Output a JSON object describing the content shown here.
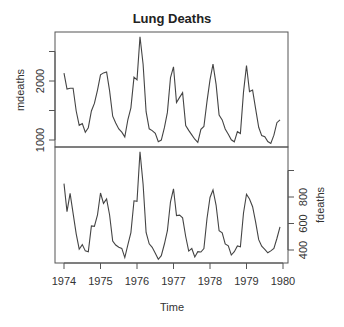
{
  "chart_data": {
    "type": "line",
    "title": "Lung Deaths",
    "xlabel": "Time",
    "x_ticks": [
      "1974",
      "1975",
      "1976",
      "1977",
      "1978",
      "1979",
      "1980"
    ],
    "x_range": [
      1974,
      1980
    ],
    "frequency": 12,
    "start": 1974,
    "grid": false,
    "legend": null,
    "panels": [
      {
        "name": "mdeaths",
        "ylabel": "mdeaths",
        "axis_side": "left",
        "y_ticks": [
          1000,
          1500,
          2000,
          2500
        ],
        "y_tick_labels": [
          "1000",
          "",
          "2000",
          ""
        ],
        "values": [
          2134,
          1863,
          1877,
          1877,
          1492,
          1249,
          1280,
          1131,
          1209,
          1492,
          1621,
          1846,
          2103,
          2137,
          2153,
          1833,
          1403,
          1288,
          1186,
          1133,
          1053,
          1347,
          1545,
          2066,
          2020,
          2750,
          2283,
          1479,
          1189,
          1160,
          1113,
          970,
          999,
          1208,
          1467,
          2059,
          2240,
          1634,
          1722,
          1801,
          1246,
          1162,
          1087,
          1013,
          959,
          1179,
          1229,
          1655,
          2019,
          2284,
          1942,
          1423,
          1340,
          1187,
          1098,
          1004,
          970,
          1140,
          1110,
          1812,
          2263,
          1820,
          1846,
          1531,
          1215,
          1075,
          1056,
          975,
          940,
          1081,
          1294,
          1341
        ]
      },
      {
        "name": "fdeaths",
        "ylabel": "fdeaths",
        "axis_side": "right",
        "y_ticks": [
          400,
          600,
          800,
          1000
        ],
        "y_tick_labels": [
          "400",
          "600",
          "800",
          ""
        ],
        "values": [
          901,
          689,
          827,
          677,
          522,
          406,
          441,
          393,
          387,
          582,
          578,
          666,
          830,
          752,
          785,
          664,
          467,
          438,
          421,
          412,
          343,
          440,
          531,
          771,
          767,
          1141,
          896,
          532,
          447,
          420,
          376,
          330,
          357,
          445,
          546,
          764,
          862,
          660,
          663,
          643,
          502,
          392,
          411,
          348,
          387,
          385,
          411,
          638,
          796,
          853,
          737,
          546,
          530,
          446,
          431,
          362,
          387,
          430,
          425,
          679,
          821,
          785,
          727,
          612,
          478,
          429,
          405,
          379,
          393,
          411,
          487,
          574
        ]
      }
    ]
  },
  "colors": {
    "line": "#444444",
    "axis": "#555555",
    "text": "#333333"
  }
}
